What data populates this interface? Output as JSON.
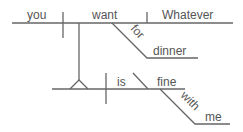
{
  "diagram": {
    "type": "sentence-diagram",
    "main_clause": {
      "subject": "you",
      "verb": "want",
      "object": "Whatever",
      "preposition": "for",
      "prep_object": "dinner"
    },
    "noun_clause": {
      "verb": "is",
      "complement": "fine",
      "preposition": "with",
      "prep_object": "me"
    },
    "line_color": "#666666",
    "text_color": "#555555"
  }
}
